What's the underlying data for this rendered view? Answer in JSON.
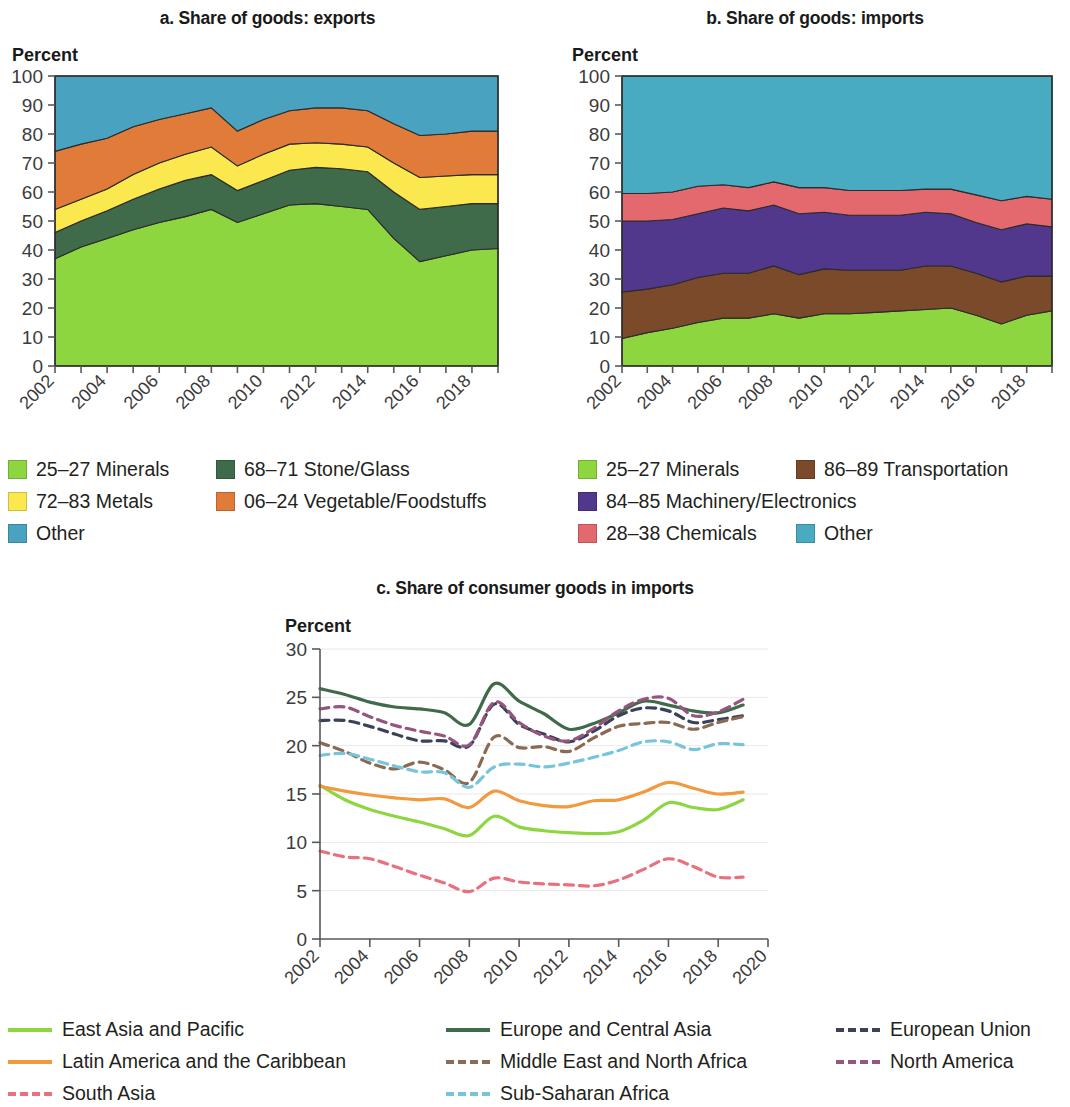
{
  "panels": {
    "a": {
      "title": "a. Share of goods: exports",
      "unit": "Percent",
      "legend": [
        {
          "label": "25–27 Minerals",
          "color": "#8ed63f"
        },
        {
          "label": "68–71 Stone/Glass",
          "color": "#3f6b4b"
        },
        {
          "label": "72–83 Metals",
          "color": "#fbe84e"
        },
        {
          "label": "06–24 Vegetable/Foodstuffs",
          "color": "#e07b39"
        },
        {
          "label": "Other",
          "color": "#49a3c0"
        }
      ]
    },
    "b": {
      "title": "b. Share of goods: imports",
      "unit": "Percent",
      "legend": [
        {
          "label": "25–27 Minerals",
          "color": "#8ed63f"
        },
        {
          "label": "86–89 Transportation",
          "color": "#7a4a2a"
        },
        {
          "label": "84–85 Machinery/Electronics",
          "color": "#51388c"
        },
        {
          "label": "28–38 Chemicals",
          "color": "#e3696e"
        },
        {
          "label": "Other",
          "color": "#49abc2"
        }
      ]
    },
    "c": {
      "title": "c. Share of consumer goods in imports",
      "unit": "Percent",
      "legend": [
        {
          "label": "East Asia and Pacific",
          "color": "#8ed63f",
          "dashed": false
        },
        {
          "label": "Europe and Central Asia",
          "color": "#3f6b4b",
          "dashed": false
        },
        {
          "label": "European Union",
          "color": "#3b4257",
          "dashed": true
        },
        {
          "label": "Latin America and the Caribbean",
          "color": "#f2993d",
          "dashed": false
        },
        {
          "label": "Middle East and North Africa",
          "color": "#8a6a52",
          "dashed": true
        },
        {
          "label": "North America",
          "color": "#97547f",
          "dashed": true
        },
        {
          "label": "South Asia",
          "color": "#e8707f",
          "dashed": true
        },
        {
          "label": "Sub-Saharan Africa",
          "color": "#77c5dd",
          "dashed": true
        }
      ]
    }
  },
  "chart_data": [
    {
      "type": "area",
      "panel": "a",
      "title": "a. Share of goods: exports",
      "stacked": true,
      "ylabel": "Percent",
      "xlabel": "",
      "ylim": [
        0,
        100
      ],
      "yticks": [
        0,
        10,
        20,
        30,
        40,
        50,
        60,
        70,
        80,
        90,
        100
      ],
      "xlim": [
        2002,
        2019
      ],
      "xticks": [
        2002,
        2004,
        2006,
        2008,
        2010,
        2012,
        2014,
        2016,
        2018
      ],
      "x": [
        2002,
        2003,
        2004,
        2005,
        2006,
        2007,
        2008,
        2009,
        2010,
        2011,
        2012,
        2013,
        2014,
        2015,
        2016,
        2017,
        2018,
        2019
      ],
      "grid": false,
      "legend_position": "below",
      "series": [
        {
          "name": "25–27 Minerals",
          "color": "#8ed63f",
          "values": [
            37.0,
            41.0,
            44.0,
            47.0,
            49.5,
            51.5,
            54.0,
            49.5,
            52.5,
            55.5,
            56.0,
            55.0,
            54.0,
            44.0,
            36.0,
            38.0,
            40.0,
            40.5
          ]
        },
        {
          "name": "68–71 Stone/Glass",
          "color": "#3f6b4b",
          "values": [
            9.0,
            9.0,
            9.5,
            10.5,
            11.5,
            12.5,
            12.0,
            11.0,
            11.5,
            12.0,
            12.5,
            13.0,
            13.0,
            16.0,
            18.0,
            17.0,
            16.0,
            15.5
          ]
        },
        {
          "name": "72–83 Metals",
          "color": "#fbe84e",
          "values": [
            8.0,
            7.5,
            7.5,
            8.5,
            9.0,
            9.0,
            9.5,
            8.5,
            9.0,
            9.0,
            8.5,
            8.5,
            8.5,
            10.0,
            11.0,
            10.5,
            10.0,
            10.0
          ]
        },
        {
          "name": "06–24 Vegetable/Foodstuffs",
          "color": "#e07b39",
          "values": [
            20.0,
            19.0,
            17.5,
            16.5,
            15.0,
            14.0,
            13.5,
            12.0,
            12.0,
            11.5,
            12.0,
            12.5,
            12.5,
            13.5,
            14.5,
            14.5,
            15.0,
            15.0
          ]
        },
        {
          "name": "Other",
          "color": "#49a3c0",
          "values": [
            26.0,
            23.5,
            21.5,
            17.5,
            15.0,
            13.0,
            11.0,
            19.0,
            15.0,
            12.0,
            11.0,
            11.0,
            12.0,
            16.5,
            20.5,
            20.0,
            19.0,
            19.0
          ]
        }
      ]
    },
    {
      "type": "area",
      "panel": "b",
      "title": "b. Share of goods: imports",
      "stacked": true,
      "ylabel": "Percent",
      "xlabel": "",
      "ylim": [
        0,
        100
      ],
      "yticks": [
        0,
        10,
        20,
        30,
        40,
        50,
        60,
        70,
        80,
        90,
        100
      ],
      "xlim": [
        2002,
        2019
      ],
      "xticks": [
        2002,
        2004,
        2006,
        2008,
        2010,
        2012,
        2014,
        2016,
        2018
      ],
      "x": [
        2002,
        2003,
        2004,
        2005,
        2006,
        2007,
        2008,
        2009,
        2010,
        2011,
        2012,
        2013,
        2014,
        2015,
        2016,
        2017,
        2018,
        2019
      ],
      "grid": false,
      "legend_position": "below",
      "series": [
        {
          "name": "25–27 Minerals",
          "color": "#8ed63f",
          "values": [
            9.5,
            11.5,
            13.0,
            15.0,
            16.5,
            16.5,
            18.0,
            16.5,
            18.0,
            18.0,
            18.5,
            19.0,
            19.5,
            20.0,
            17.5,
            14.5,
            17.5,
            19.0,
            16.5
          ]
        },
        {
          "name": "86–89 Transportation",
          "color": "#7a4a2a",
          "values": [
            16.0,
            15.0,
            15.0,
            15.5,
            15.5,
            15.5,
            16.5,
            15.0,
            15.5,
            15.0,
            14.5,
            14.0,
            15.0,
            14.5,
            14.5,
            14.5,
            13.5,
            12.0,
            13.0
          ]
        },
        {
          "name": "84–85 Machinery/Electronics",
          "color": "#51388c",
          "values": [
            24.5,
            23.5,
            22.5,
            22.0,
            22.5,
            21.5,
            21.0,
            21.0,
            19.5,
            19.0,
            19.0,
            19.0,
            18.5,
            18.0,
            17.5,
            18.0,
            18.0,
            17.0,
            18.5
          ]
        },
        {
          "name": "28–38 Chemicals",
          "color": "#e3696e",
          "values": [
            9.5,
            9.5,
            9.5,
            9.5,
            8.0,
            8.0,
            8.0,
            9.0,
            8.5,
            8.5,
            8.5,
            8.5,
            8.0,
            8.5,
            9.5,
            10.0,
            9.5,
            9.5,
            9.5
          ]
        },
        {
          "name": "Other",
          "color": "#49abc2",
          "values": [
            40.5,
            40.5,
            40.0,
            38.0,
            37.5,
            38.5,
            36.5,
            38.5,
            38.5,
            39.5,
            39.5,
            39.5,
            39.0,
            39.0,
            41.0,
            43.0,
            41.5,
            42.5,
            42.5
          ]
        }
      ]
    },
    {
      "type": "line",
      "panel": "c",
      "title": "c. Share of consumer goods in imports",
      "ylabel": "Percent",
      "xlabel": "",
      "ylim": [
        0,
        30
      ],
      "yticks": [
        0,
        5,
        10,
        15,
        20,
        25,
        30
      ],
      "xlim": [
        2002,
        2020
      ],
      "xticks": [
        2002,
        2004,
        2006,
        2008,
        2010,
        2012,
        2014,
        2016,
        2018,
        2020
      ],
      "x": [
        2002,
        2003,
        2004,
        2005,
        2006,
        2007,
        2008,
        2009,
        2010,
        2011,
        2012,
        2013,
        2014,
        2015,
        2016,
        2017,
        2018,
        2019
      ],
      "grid": true,
      "legend_position": "below",
      "series": [
        {
          "name": "East Asia and Pacific",
          "color": "#8ed63f",
          "dashed": false,
          "values": [
            15.9,
            14.4,
            13.4,
            12.7,
            12.1,
            11.4,
            10.7,
            12.7,
            11.6,
            11.2,
            11.0,
            10.9,
            11.1,
            12.3,
            14.1,
            13.6,
            13.4,
            14.4
          ]
        },
        {
          "name": "Europe and Central Asia",
          "color": "#3f6b4b",
          "dashed": false,
          "values": [
            25.9,
            25.3,
            24.5,
            24.0,
            23.8,
            23.4,
            22.2,
            26.4,
            24.6,
            23.3,
            21.7,
            22.3,
            23.4,
            24.6,
            24.2,
            23.6,
            23.4,
            24.2
          ]
        },
        {
          "name": "European Union",
          "color": "#3b4257",
          "dashed": true,
          "values": [
            22.6,
            22.6,
            22.0,
            21.2,
            20.5,
            20.5,
            20.0,
            24.3,
            22.2,
            21.2,
            20.4,
            21.5,
            23.1,
            23.9,
            23.6,
            22.4,
            22.7,
            23.1
          ]
        },
        {
          "name": "Latin America and the Caribbean",
          "color": "#f2993d",
          "dashed": false,
          "values": [
            15.8,
            15.3,
            14.9,
            14.6,
            14.4,
            14.5,
            13.6,
            15.3,
            14.3,
            13.8,
            13.7,
            14.3,
            14.4,
            15.2,
            16.2,
            15.6,
            15.0,
            15.2
          ]
        },
        {
          "name": "Middle East and North Africa",
          "color": "#8a6a52",
          "dashed": true,
          "values": [
            20.3,
            19.4,
            18.2,
            17.6,
            18.3,
            17.5,
            16.2,
            20.9,
            19.8,
            19.9,
            19.4,
            20.8,
            22.0,
            22.3,
            22.4,
            21.7,
            22.4,
            23.0
          ]
        },
        {
          "name": "North America",
          "color": "#97547f",
          "dashed": true,
          "values": [
            23.8,
            24.0,
            23.0,
            22.1,
            21.5,
            21.0,
            20.1,
            24.5,
            22.4,
            21.0,
            20.5,
            21.8,
            23.6,
            24.8,
            24.9,
            23.1,
            23.5,
            24.8
          ]
        },
        {
          "name": "South Asia",
          "color": "#e8707f",
          "dashed": true,
          "values": [
            9.1,
            8.5,
            8.3,
            7.5,
            6.6,
            5.8,
            4.9,
            6.3,
            5.9,
            5.7,
            5.6,
            5.5,
            6.1,
            7.2,
            8.3,
            7.5,
            6.4,
            6.4
          ]
        },
        {
          "name": "Sub-Saharan Africa",
          "color": "#77c5dd",
          "dashed": true,
          "values": [
            19.0,
            19.2,
            18.6,
            17.9,
            17.3,
            17.2,
            15.7,
            17.8,
            18.1,
            17.8,
            18.2,
            18.8,
            19.5,
            20.4,
            20.4,
            19.6,
            20.2,
            20.1
          ]
        }
      ]
    }
  ]
}
